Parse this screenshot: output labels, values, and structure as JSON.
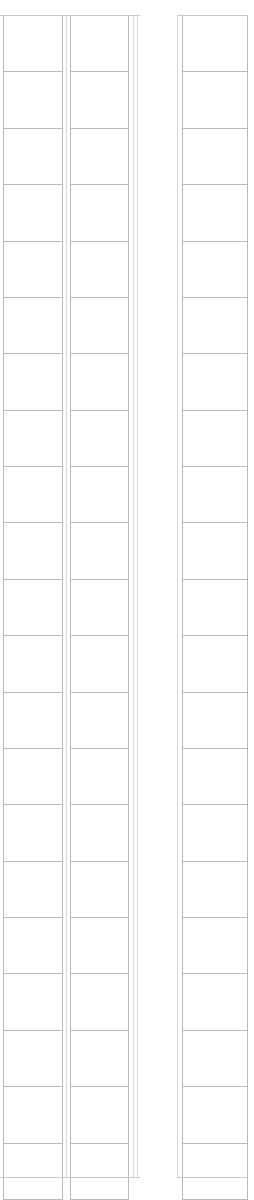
{
  "page": {
    "background_color": "#ffffff",
    "rule_color": "#b9b9b9",
    "faint_rule_color": "#d8d8d8",
    "width_px": 254,
    "height_px": 1184
  },
  "tables": [
    {
      "name": "left-table",
      "x": 3,
      "y": 15,
      "width": 135,
      "height": 1163,
      "columns": 2,
      "rows": 21,
      "column_widths": [
        59,
        66
      ],
      "header_labels": [
        "",
        ""
      ],
      "cells": [
        [
          "",
          ""
        ],
        [
          "",
          ""
        ],
        [
          "",
          ""
        ],
        [
          "",
          ""
        ],
        [
          "",
          ""
        ],
        [
          "",
          ""
        ],
        [
          "",
          ""
        ],
        [
          "",
          ""
        ],
        [
          "",
          ""
        ],
        [
          "",
          ""
        ],
        [
          "",
          ""
        ],
        [
          "",
          ""
        ],
        [
          "",
          ""
        ],
        [
          "",
          ""
        ],
        [
          "",
          ""
        ],
        [
          "",
          ""
        ],
        [
          "",
          ""
        ],
        [
          "",
          ""
        ],
        [
          "",
          ""
        ],
        [
          "",
          ""
        ],
        [
          "",
          ""
        ]
      ]
    },
    {
      "name": "right-table",
      "x": 177,
      "y": 15,
      "width": 71,
      "height": 1163,
      "columns": 1,
      "rows": 21,
      "column_widths": [
        71
      ],
      "header_labels": [
        ""
      ],
      "cells": [
        [
          ""
        ],
        [
          ""
        ],
        [
          ""
        ],
        [
          ""
        ],
        [
          ""
        ],
        [
          ""
        ],
        [
          ""
        ],
        [
          ""
        ],
        [
          ""
        ],
        [
          ""
        ],
        [
          ""
        ],
        [
          ""
        ],
        [
          ""
        ],
        [
          ""
        ],
        [
          ""
        ],
        [
          ""
        ],
        [
          ""
        ],
        [
          ""
        ],
        [
          ""
        ],
        [
          ""
        ],
        [
          ""
        ]
      ]
    }
  ],
  "rules": {
    "left_outer_edge_x": 3,
    "left_inner_divider_x": 62,
    "left_gutter_x": 70,
    "left_second_divider_x": 128,
    "left_right_edge_x": 137,
    "right_outer_edge_x": 177,
    "right_inner_edge_x": 186,
    "right_right_edge_x": 247,
    "top_y": 15,
    "bottom_y": 1177,
    "row_height": 55.4
  }
}
